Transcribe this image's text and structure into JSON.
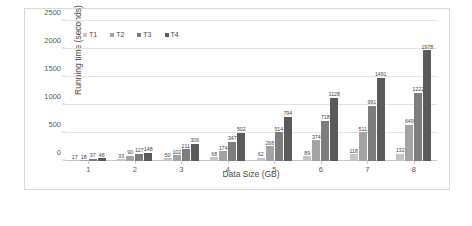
{
  "chart_data": {
    "type": "bar",
    "title": "",
    "xlabel": "Data Size (GB)",
    "ylabel": "Running time (seconds)",
    "categories": [
      "1",
      "2",
      "3",
      "4",
      "5",
      "6",
      "7",
      "8"
    ],
    "ylim": [
      0,
      2500
    ],
    "yticks": [
      "0",
      "500",
      "1000",
      "1500",
      "2000",
      "2500"
    ],
    "grid": true,
    "legend_position": "top-left",
    "series": [
      {
        "name": "T1",
        "color": "#c5c5c5",
        "values": [
          17,
          33,
          50,
          68,
          62,
          89,
          118,
          132
        ]
      },
      {
        "name": "T2",
        "color": "#a3a3a3",
        "values": [
          18,
          90,
          102,
          174,
          268,
          374,
          511,
          649
        ]
      },
      {
        "name": "T3",
        "color": "#7d7d7d",
        "values": [
          37,
          127,
          211,
          347,
          514,
          718,
          991,
          1222
        ]
      },
      {
        "name": "T4",
        "color": "#5a5a5a",
        "values": [
          46,
          148,
          306,
          502,
          794,
          1128,
          1491,
          1978
        ]
      }
    ]
  }
}
